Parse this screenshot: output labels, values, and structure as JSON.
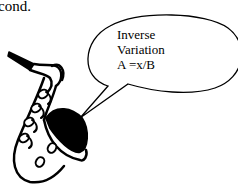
{
  "top_text": "cond.",
  "bubble": {
    "lines": [
      "Inverse",
      "Variation",
      "A =x/B"
    ]
  },
  "illustration": "saxophone-icon"
}
